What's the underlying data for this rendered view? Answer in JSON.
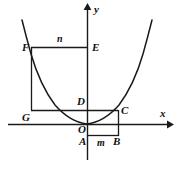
{
  "figure": {
    "kind": "geometry-diagram",
    "colors": {
      "background": "#ffffff",
      "stroke": "#1a1a1a",
      "label": "#101010"
    },
    "axes": {
      "x_label": "x",
      "y_label": "y",
      "origin_label": "O"
    },
    "points": [
      {
        "name": "F",
        "label": "F",
        "x": 31,
        "y": 47,
        "label_x": 22,
        "label_y": 42
      },
      {
        "name": "E",
        "label": "E",
        "x": 87,
        "y": 47,
        "label_x": 92,
        "label_y": 42
      },
      {
        "name": "D",
        "label": "D",
        "x": 87,
        "y": 110,
        "label_x": 77,
        "label_y": 96
      },
      {
        "name": "G",
        "label": "G",
        "x": 31,
        "y": 110,
        "label_x": 22,
        "label_y": 112
      },
      {
        "name": "C",
        "label": "C",
        "x": 118,
        "y": 110,
        "label_x": 121,
        "label_y": 105
      },
      {
        "name": "O",
        "label": "O",
        "x": 87,
        "y": 124,
        "label_x": 78,
        "label_y": 124
      },
      {
        "name": "A",
        "label": "A",
        "x": 87,
        "y": 136,
        "label_x": 79,
        "label_y": 136
      },
      {
        "name": "B",
        "label": "B",
        "x": 118,
        "y": 136,
        "label_x": 113,
        "label_y": 136
      }
    ],
    "segment_labels": [
      {
        "name": "n",
        "label": "n",
        "label_x": 57,
        "label_y": 34
      },
      {
        "name": "m",
        "label": "m",
        "label_x": 97,
        "label_y": 137
      }
    ],
    "curve": {
      "name": "parabola",
      "vertex_x": 87,
      "vertex_y": 124
    }
  }
}
